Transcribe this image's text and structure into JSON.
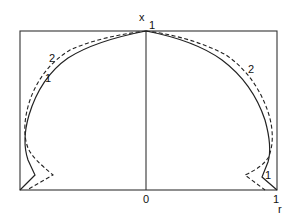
{
  "diagram": {
    "axes": {
      "vertical_label": "x",
      "vertical_top_tick": "1",
      "horizontal_label": "r",
      "origin_tick": "0",
      "right_tick": "1"
    },
    "curves": [
      {
        "id": "1",
        "label": "1",
        "style": "solid"
      },
      {
        "id": "2",
        "label": "2",
        "style": "dashed"
      }
    ],
    "curve_labels": {
      "left_curve2": "2",
      "left_curve1": "1",
      "right_curve2": "2",
      "right_curve1": "1"
    },
    "colors": {
      "line": "#222222",
      "background": "#ffffff"
    }
  }
}
